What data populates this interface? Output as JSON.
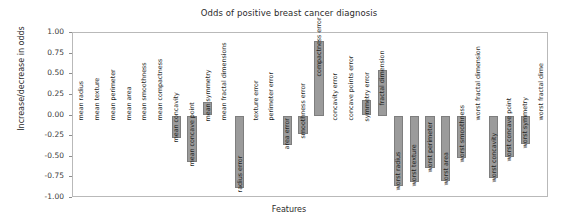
{
  "chart_data": {
    "type": "bar",
    "title": "Odds of positive breast cancer diagnosis",
    "xlabel": "Features",
    "ylabel": "Increase/decrease in odds",
    "ylim": [
      -1.0,
      1.0
    ],
    "ytick_labels": [
      "1.00",
      "0.75",
      "0.50",
      "0.25",
      "0.00",
      "-0.25",
      "-0.50",
      "-0.75",
      "-1.00"
    ],
    "ytick_values": [
      1.0,
      0.75,
      0.5,
      0.25,
      0.0,
      -0.25,
      -0.5,
      -0.75,
      -1.0
    ],
    "grid": false,
    "legend": null,
    "bar_color": "#9b9b9b",
    "bar_edge_color": "#7e7e7e",
    "categories": [
      "mean radius",
      "mean texture",
      "mean perimeter",
      "mean area",
      "mean smoothness",
      "mean compactness",
      "mean concavity",
      "mean concave point",
      "mean symmetry",
      "mean fractal dimensions",
      "radius error",
      "texture error",
      "perimeter error",
      "area error",
      "smoothness error",
      "compactness error",
      "concavity error",
      "concave points error",
      "symmetry error",
      "fractal dimension",
      "worst radius",
      "worst texture",
      "worst perimeter",
      "worst area",
      "worst smoothness",
      "worst fractal dimension",
      "worst concavity",
      "worst concave point",
      "worst symmetry",
      "worst fractal dime"
    ],
    "values": [
      0.0,
      0.0,
      0.0,
      0.0,
      0.0,
      0.0,
      -0.27,
      -0.56,
      0.16,
      0.0,
      -0.88,
      0.0,
      0.0,
      -0.36,
      -0.23,
      0.9,
      0.0,
      0.0,
      0.19,
      0.55,
      -0.86,
      -0.8,
      -0.64,
      -0.79,
      -0.51,
      0.0,
      -0.76,
      -0.5,
      -0.34,
      0.0
    ]
  }
}
